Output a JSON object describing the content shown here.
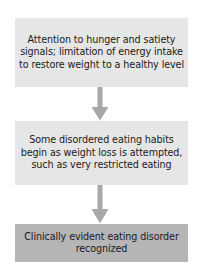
{
  "diagram": {
    "orientation": "vertical-top-to-bottom",
    "background_color": "#ffffff",
    "text_color": "#1a1a1a",
    "nodes": [
      {
        "id": "healthy",
        "label": "Attention to hunger and satiety signals; limitation of energy intake to restore weight to a healthy level",
        "fill_color": "#e6e6e6",
        "shape": "rectangle",
        "order": 1
      },
      {
        "id": "disordered",
        "label": "Some disordered eating habits begin as weight loss is attempted, such as very restricted eating",
        "fill_color": "#e6e6e6",
        "shape": "rectangle",
        "order": 2
      },
      {
        "id": "clinical",
        "label": "Clinically evident eating disorder recognized",
        "fill_color": "#b5b5b5",
        "shape": "rectangle",
        "order": 3
      }
    ],
    "connectors": [
      {
        "id": "healthy-to-disordered",
        "from": "healthy",
        "to": "disordered",
        "icon": "down-arrow-icon",
        "color": "#a8a8a8"
      },
      {
        "id": "disordered-to-clinical",
        "from": "disordered",
        "to": "clinical",
        "icon": "down-arrow-icon",
        "color": "#a8a8a8"
      }
    ]
  }
}
